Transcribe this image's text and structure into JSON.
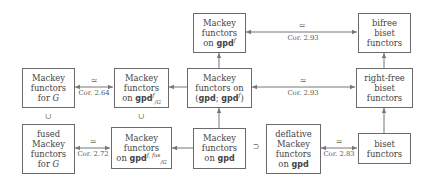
{
  "diagram": {
    "nodes": {
      "mackey_G": {
        "line1": "Mackey",
        "line2": "functors",
        "line3_pre": "for ",
        "line3_var": "G"
      },
      "mackey_gpdf_G": {
        "line1": "Mackey",
        "line2": "functors",
        "line3_pre": "on ",
        "line3_bold": "gpd",
        "sup": "f",
        "sub": "/G"
      },
      "mackey_pair": {
        "line1": "Mackey",
        "line2": "functors on",
        "line3_open": "(",
        "line3_bold1": "gpd",
        "line3_sep": "; ",
        "line3_bold2": "gpd",
        "sup": "f",
        "line3_close": ")"
      },
      "mackey_gpdf": {
        "line1": "Mackey",
        "line2": "functors",
        "line3_pre": "on ",
        "line3_bold": "gpd",
        "sup": "f"
      },
      "bifree_biset": {
        "line1": "bifree",
        "line2": "biset",
        "line3": "functors"
      },
      "rightfree_biset": {
        "line1": "right-free",
        "line2": "biset",
        "line3": "functors"
      },
      "fused_mackey_G": {
        "line1": "fused",
        "line2": "Mackey",
        "line3": "functors",
        "line4_pre": "for ",
        "line4_var": "G"
      },
      "mackey_gpdffus_G": {
        "line1": "Mackey",
        "line2": "functors",
        "line3_pre": "on ",
        "line3_bold": "gpd",
        "sup": "f, fus",
        "sub": "/G"
      },
      "mackey_gpd": {
        "line1": "Mackey",
        "line2": "functors",
        "line3_pre": "on ",
        "line3_bold": "gpd"
      },
      "deflative_mackey": {
        "line1": "deflative",
        "line2": "Mackey",
        "line3": "functors",
        "line4_pre": "on ",
        "line4_bold": "gpd"
      },
      "biset": {
        "line1": "biset",
        "line2": "functors"
      }
    },
    "edges": [
      {
        "from": "mackey_gpdf",
        "to": "bifree_biset",
        "type": "double-arrow",
        "symbol": "≃",
        "label": "Cor. 2.93"
      },
      {
        "from": "mackey_pair",
        "to": "rightfree_biset",
        "type": "double-arrow",
        "symbol": "≃",
        "label": "Cor. 2.93"
      },
      {
        "from": "mackey_G",
        "to": "mackey_gpdf_G",
        "type": "double-arrow",
        "symbol": "≃",
        "label": "Cor. 2.64"
      },
      {
        "from": "fused_mackey_G",
        "to": "mackey_gpdffus_G",
        "type": "double-arrow",
        "symbol": "≃",
        "label": "Cor. 2.72"
      },
      {
        "from": "deflative_mackey",
        "to": "biset",
        "type": "double-arrow",
        "symbol": "≃",
        "label": "Cor. 2.83"
      },
      {
        "from": "mackey_pair",
        "to": "mackey_gpdf",
        "type": "arrow"
      },
      {
        "from": "mackey_gpd",
        "to": "mackey_pair",
        "type": "arrow"
      },
      {
        "from": "mackey_pair",
        "to": "mackey_gpdf_G",
        "type": "arrow"
      },
      {
        "from": "mackey_gpd",
        "to": "mackey_gpdffus_G",
        "type": "arrow"
      },
      {
        "from": "rightfree_biset",
        "to": "bifree_biset",
        "type": "arrow"
      },
      {
        "from": "biset",
        "to": "rightfree_biset",
        "type": "arrow"
      }
    ],
    "relations": {
      "subset_left": "∪",
      "subset_mid": "∪",
      "supset_right": "⊃"
    }
  }
}
